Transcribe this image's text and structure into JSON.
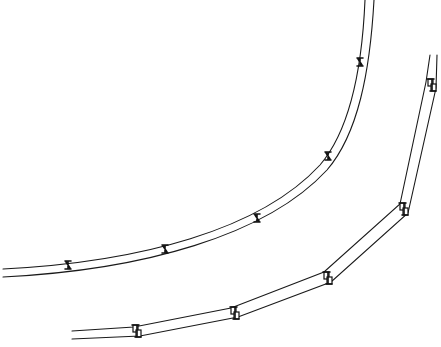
{
  "figure": {
    "background": "#ffffff",
    "stroke_color": "#1a1a1a"
  },
  "curved_strip": {
    "label": "smooth curved strip",
    "rail_gap": 8,
    "path": "M 3 269 C 140 262, 260 230, 320 165 C 350 130, 362 70, 367 0",
    "joint_type": "x-clip",
    "joints": [
      {
        "x": 68,
        "y": 265
      },
      {
        "x": 165,
        "y": 249
      },
      {
        "x": 257,
        "y": 218
      },
      {
        "x": 328,
        "y": 156
      },
      {
        "x": 360,
        "y": 62
      }
    ]
  },
  "segmented_strip": {
    "label": "segmented straight strip",
    "rail_gap": 8,
    "points": [
      {
        "x": 72,
        "y": 331
      },
      {
        "x": 137,
        "y": 327
      },
      {
        "x": 234,
        "y": 309
      },
      {
        "x": 327,
        "y": 274
      },
      {
        "x": 403,
        "y": 205
      },
      {
        "x": 428,
        "y": 82
      },
      {
        "x": 432,
        "y": 55
      }
    ],
    "joint_type": "offset-box",
    "joints": [
      {
        "x": 137,
        "y": 331
      },
      {
        "x": 235,
        "y": 313
      },
      {
        "x": 328,
        "y": 278
      },
      {
        "x": 404,
        "y": 209
      },
      {
        "x": 432,
        "y": 85
      }
    ]
  }
}
